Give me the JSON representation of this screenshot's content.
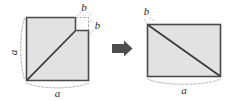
{
  "figure": {
    "background_color": "#ffffff",
    "fill_color": "#e2e2e2",
    "edge_color": "#4a4a4a",
    "guide_color": "#a8a8a8",
    "arrow_color": "#4d4d4d"
  },
  "left_figure": {
    "name": "notched-square",
    "labels": {
      "side_left": "a",
      "side_bottom": "a",
      "notch_top": "b",
      "notch_right": "b"
    }
  },
  "transform_arrow": {
    "name": "rightwards-arrow",
    "glyph": "➡",
    "direction": "right"
  },
  "right_figure": {
    "name": "rectangle-with-diagonal",
    "labels": {
      "corner_top_left": "b",
      "side_bottom": "a"
    }
  }
}
